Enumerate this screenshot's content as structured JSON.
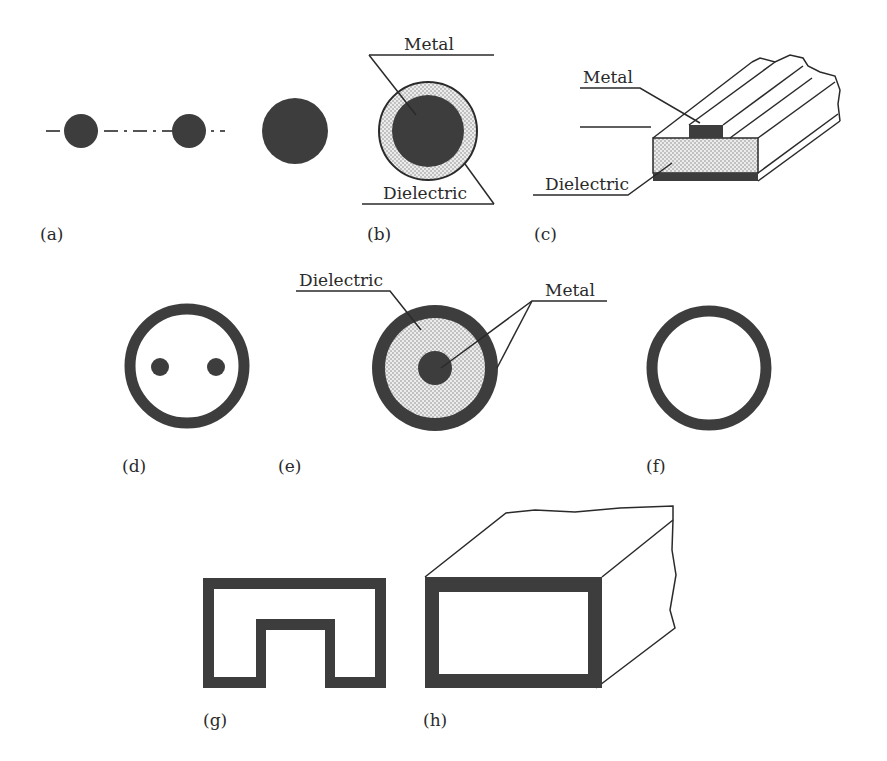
{
  "figure": {
    "panels": [
      {
        "id": "a",
        "label": "(a)",
        "description": "Two-wire line and single wire"
      },
      {
        "id": "b",
        "label": "(b)",
        "description": "Dielectric-coated wire",
        "callouts": [
          "Metal",
          "Dielectric"
        ]
      },
      {
        "id": "c",
        "label": "(c)",
        "description": "Microstrip line",
        "callouts": [
          "Metal",
          "Dielectric"
        ]
      },
      {
        "id": "d",
        "label": "(d)",
        "description": "Shielded two-wire line"
      },
      {
        "id": "e",
        "label": "(e)",
        "description": "Coaxial line",
        "callouts": [
          "Dielectric",
          "Metal"
        ]
      },
      {
        "id": "f",
        "label": "(f)",
        "description": "Circular waveguide"
      },
      {
        "id": "g",
        "label": "(g)",
        "description": "Ridge waveguide"
      },
      {
        "id": "h",
        "label": "(h)",
        "description": "Rectangular waveguide"
      }
    ],
    "text": {
      "a_label": "(a)",
      "b_label": "(b)",
      "c_label": "(c)",
      "d_label": "(d)",
      "e_label": "(e)",
      "f_label": "(f)",
      "g_label": "(g)",
      "h_label": "(h)",
      "b_metal": "Metal",
      "b_dielectric": "Dielectric",
      "c_metal": "Metal",
      "c_dielectric": "Dielectric",
      "e_dielectric": "Dielectric",
      "e_metal": "Metal"
    },
    "colors": {
      "metal": "#3d3d3d",
      "dielectric": "#e4e4e4",
      "line": "#2a2a2a",
      "background": "#ffffff"
    }
  }
}
